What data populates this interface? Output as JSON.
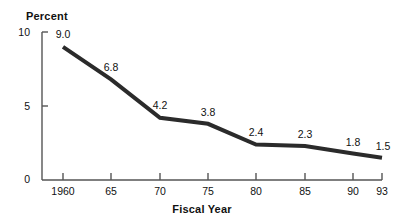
{
  "chart_data": {
    "type": "line",
    "title": "",
    "xlabel": "Fiscal Year",
    "ylabel": "Percent",
    "categories": [
      "1960",
      "65",
      "70",
      "75",
      "80",
      "85",
      "90",
      "93"
    ],
    "values": [
      9.0,
      6.8,
      4.2,
      3.8,
      2.4,
      2.3,
      1.8,
      1.5
    ],
    "point_labels": [
      "9.0",
      "6.8",
      "4.2",
      "3.8",
      "2.4",
      "2.3",
      "1.8",
      "1.5"
    ],
    "ylim": [
      0,
      10
    ],
    "y_ticks": [
      "0",
      "5",
      "10"
    ],
    "y_tick_values": [
      0,
      5,
      10
    ],
    "grid": false,
    "legend": "none",
    "line_color": "#2b2b2b",
    "axis_color": "#555555",
    "text_color": "#111111"
  },
  "axes": {
    "y_title": "Percent",
    "x_title": "Fiscal Year",
    "y_tick_labels": [
      "10",
      "5",
      "0"
    ],
    "x_tick_labels": [
      "1960",
      "65",
      "70",
      "75",
      "80",
      "85",
      "90",
      "93"
    ]
  },
  "series_labels": {
    "p0": "9.0",
    "p1": "6.8",
    "p2": "4.2",
    "p3": "3.8",
    "p4": "2.4",
    "p5": "2.3",
    "p6": "1.8",
    "p7": "1.5"
  }
}
